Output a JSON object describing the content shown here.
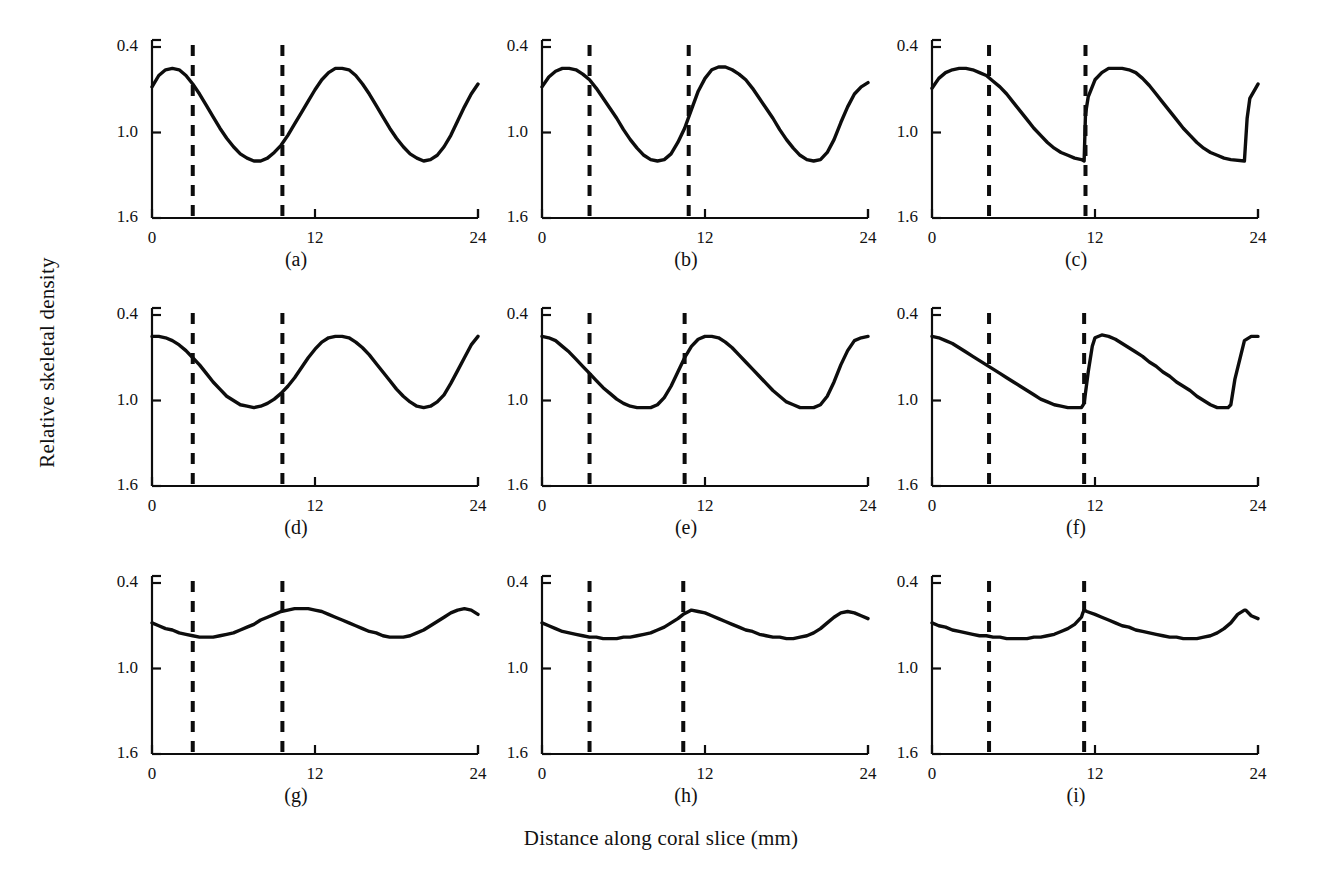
{
  "figure": {
    "ylabel": "Relative skeletal density",
    "xlabel": "Distance along coral slice (mm)",
    "line_color": "#0d0d0d",
    "marker_color": "#0d0d0d"
  },
  "axes": {
    "y_ticks": [
      "1.6",
      "1.0",
      "0.4"
    ],
    "y_tick_values": [
      1.6,
      1.0,
      0.4
    ],
    "x_ticks": [
      "0",
      "12",
      "24"
    ],
    "x_tick_values": [
      0,
      12,
      24
    ],
    "xlim": [
      0,
      24
    ],
    "ylim": [
      0.4,
      1.6
    ]
  },
  "captions": {
    "a": "(a)",
    "b": "(b)",
    "c": "(c)",
    "d": "(d)",
    "e": "(e)",
    "f": "(f)",
    "g": "(g)",
    "h": "(h)",
    "i": "(i)"
  },
  "chart_data": [
    {
      "id": "a",
      "type": "line",
      "title": "(a)",
      "xlabel": "",
      "ylabel": "",
      "xlim": [
        0,
        24
      ],
      "ylim": [
        0.4,
        1.6
      ],
      "xticks": [
        0,
        12,
        24
      ],
      "yticks": [
        0.4,
        1.0,
        1.6
      ],
      "grid": false,
      "legend": "none",
      "annotations": [
        {
          "type": "vertical-dashed-line",
          "x": 3.0
        },
        {
          "type": "vertical-dashed-line",
          "x": 9.6
        }
      ],
      "x": [
        0,
        0.5,
        1,
        1.5,
        2,
        2.5,
        3,
        3.5,
        4,
        4.5,
        5,
        5.5,
        6,
        6.5,
        7,
        7.5,
        8,
        8.5,
        9,
        9.5,
        10,
        10.5,
        11,
        11.5,
        12,
        12.5,
        13,
        13.5,
        14,
        14.5,
        15,
        15.5,
        16,
        16.5,
        17,
        17.5,
        18,
        18.5,
        19,
        19.5,
        20,
        20.5,
        21,
        21.5,
        22,
        22.5,
        23,
        23.5,
        24
      ],
      "values": [
        1.32,
        1.4,
        1.44,
        1.45,
        1.44,
        1.4,
        1.34,
        1.27,
        1.19,
        1.11,
        1.03,
        0.96,
        0.9,
        0.85,
        0.82,
        0.8,
        0.8,
        0.82,
        0.86,
        0.91,
        0.98,
        1.06,
        1.14,
        1.22,
        1.3,
        1.37,
        1.42,
        1.45,
        1.45,
        1.44,
        1.4,
        1.34,
        1.27,
        1.19,
        1.11,
        1.03,
        0.96,
        0.9,
        0.85,
        0.82,
        0.8,
        0.81,
        0.84,
        0.9,
        0.98,
        1.08,
        1.18,
        1.27,
        1.34
      ]
    },
    {
      "id": "b",
      "type": "line",
      "title": "(b)",
      "xlim": [
        0,
        24
      ],
      "ylim": [
        0.4,
        1.6
      ],
      "xticks": [
        0,
        12,
        24
      ],
      "yticks": [
        0.4,
        1.0,
        1.6
      ],
      "grid": false,
      "legend": "none",
      "annotations": [
        {
          "type": "vertical-dashed-line",
          "x": 3.5
        },
        {
          "type": "vertical-dashed-line",
          "x": 10.8
        }
      ],
      "x": [
        0,
        0.5,
        1,
        1.5,
        2,
        2.5,
        3,
        3.5,
        4,
        4.5,
        5,
        5.5,
        6,
        6.5,
        7,
        7.5,
        8,
        8.5,
        9,
        9.5,
        10,
        10.5,
        11,
        11.5,
        12,
        12.5,
        13,
        13.5,
        14,
        14.5,
        15,
        15.5,
        16,
        16.5,
        17,
        17.5,
        18,
        18.5,
        19,
        19.5,
        20,
        20.5,
        21,
        21.5,
        22,
        22.5,
        23,
        23.5,
        24
      ],
      "values": [
        1.32,
        1.39,
        1.43,
        1.45,
        1.45,
        1.44,
        1.41,
        1.37,
        1.31,
        1.24,
        1.17,
        1.1,
        1.02,
        0.95,
        0.89,
        0.84,
        0.81,
        0.8,
        0.81,
        0.85,
        0.93,
        1.03,
        1.16,
        1.29,
        1.38,
        1.44,
        1.46,
        1.46,
        1.44,
        1.41,
        1.37,
        1.31,
        1.24,
        1.17,
        1.1,
        1.02,
        0.95,
        0.89,
        0.84,
        0.81,
        0.8,
        0.81,
        0.86,
        0.95,
        1.07,
        1.18,
        1.27,
        1.32,
        1.35
      ]
    },
    {
      "id": "c",
      "type": "line",
      "title": "(c)",
      "xlim": [
        0,
        24
      ],
      "ylim": [
        0.4,
        1.6
      ],
      "xticks": [
        0,
        12,
        24
      ],
      "yticks": [
        0.4,
        1.0,
        1.6
      ],
      "grid": false,
      "legend": "none",
      "annotations": [
        {
          "type": "vertical-dashed-line",
          "x": 4.2
        },
        {
          "type": "vertical-dashed-line",
          "x": 11.3
        }
      ],
      "x": [
        0,
        0.5,
        1,
        1.5,
        2,
        2.5,
        3,
        3.5,
        4,
        4.5,
        5,
        5.5,
        6,
        6.5,
        7,
        7.5,
        8,
        8.5,
        9,
        9.5,
        10,
        10.5,
        11,
        11.2,
        11.3,
        11.5,
        12,
        12.5,
        13,
        13.5,
        14,
        14.5,
        15,
        15.5,
        16,
        16.5,
        17,
        17.5,
        18,
        18.5,
        19,
        19.5,
        20,
        20.5,
        21,
        21.5,
        22,
        23,
        23.2,
        23.4,
        24
      ],
      "values": [
        1.31,
        1.38,
        1.42,
        1.44,
        1.45,
        1.45,
        1.44,
        1.42,
        1.4,
        1.36,
        1.32,
        1.27,
        1.21,
        1.15,
        1.09,
        1.03,
        0.98,
        0.93,
        0.89,
        0.86,
        0.84,
        0.82,
        0.81,
        0.8,
        1.13,
        1.25,
        1.37,
        1.42,
        1.45,
        1.45,
        1.45,
        1.44,
        1.42,
        1.38,
        1.33,
        1.27,
        1.21,
        1.15,
        1.09,
        1.03,
        0.98,
        0.93,
        0.89,
        0.86,
        0.84,
        0.82,
        0.81,
        0.8,
        1.1,
        1.24,
        1.34
      ]
    },
    {
      "id": "d",
      "type": "line",
      "title": "(d)",
      "xlim": [
        0,
        24
      ],
      "ylim": [
        0.4,
        1.6
      ],
      "xticks": [
        0,
        12,
        24
      ],
      "yticks": [
        0.4,
        1.0,
        1.6
      ],
      "grid": false,
      "legend": "none",
      "annotations": [
        {
          "type": "vertical-dashed-line",
          "x": 3.0
        },
        {
          "type": "vertical-dashed-line",
          "x": 9.6
        }
      ],
      "x": [
        0,
        0.5,
        1,
        1.5,
        2,
        2.5,
        3,
        3.5,
        4,
        4.5,
        5,
        5.5,
        6,
        6.5,
        7,
        7.5,
        8,
        8.5,
        9,
        9.5,
        10,
        10.5,
        11,
        11.5,
        12,
        12.5,
        13,
        13.5,
        14,
        14.5,
        15,
        15.5,
        16,
        16.5,
        17,
        17.5,
        18,
        18.5,
        19,
        19.5,
        20,
        20.5,
        21,
        21.5,
        22,
        22.5,
        23,
        23.5,
        24
      ],
      "values": [
        1.45,
        1.45,
        1.44,
        1.42,
        1.39,
        1.35,
        1.3,
        1.25,
        1.19,
        1.13,
        1.08,
        1.03,
        1.0,
        0.97,
        0.96,
        0.95,
        0.96,
        0.98,
        1.01,
        1.05,
        1.1,
        1.16,
        1.23,
        1.3,
        1.36,
        1.41,
        1.44,
        1.45,
        1.45,
        1.44,
        1.41,
        1.37,
        1.32,
        1.26,
        1.2,
        1.14,
        1.08,
        1.03,
        0.99,
        0.96,
        0.95,
        0.96,
        0.99,
        1.04,
        1.12,
        1.21,
        1.3,
        1.39,
        1.45
      ]
    },
    {
      "id": "e",
      "type": "line",
      "title": "(e)",
      "xlim": [
        0,
        24
      ],
      "ylim": [
        0.4,
        1.6
      ],
      "xticks": [
        0,
        12,
        24
      ],
      "yticks": [
        0.4,
        1.0,
        1.6
      ],
      "grid": false,
      "legend": "none",
      "annotations": [
        {
          "type": "vertical-dashed-line",
          "x": 3.5
        },
        {
          "type": "vertical-dashed-line",
          "x": 10.5
        }
      ],
      "x": [
        0,
        0.5,
        1,
        1.5,
        2,
        2.5,
        3,
        3.5,
        4,
        4.5,
        5,
        5.5,
        6,
        6.5,
        7,
        7.5,
        8,
        8.5,
        9,
        9.5,
        10,
        10.5,
        11,
        11.5,
        12,
        12.5,
        13,
        13.5,
        14,
        14.5,
        15,
        15.5,
        16,
        16.5,
        17,
        17.5,
        18,
        18.5,
        19,
        19.5,
        20,
        20.5,
        21,
        21.5,
        22,
        22.5,
        23,
        23.5,
        24
      ],
      "values": [
        1.45,
        1.44,
        1.42,
        1.38,
        1.34,
        1.29,
        1.24,
        1.19,
        1.14,
        1.09,
        1.05,
        1.01,
        0.98,
        0.96,
        0.95,
        0.95,
        0.95,
        0.97,
        1.02,
        1.1,
        1.2,
        1.3,
        1.38,
        1.43,
        1.45,
        1.45,
        1.44,
        1.41,
        1.37,
        1.32,
        1.27,
        1.22,
        1.17,
        1.12,
        1.07,
        1.03,
        0.99,
        0.97,
        0.95,
        0.95,
        0.95,
        0.97,
        1.03,
        1.13,
        1.25,
        1.35,
        1.42,
        1.44,
        1.45
      ]
    },
    {
      "id": "f",
      "type": "line",
      "title": "(f)",
      "xlim": [
        0,
        24
      ],
      "ylim": [
        0.4,
        1.6
      ],
      "xticks": [
        0,
        12,
        24
      ],
      "yticks": [
        0.4,
        1.0,
        1.6
      ],
      "grid": false,
      "legend": "none",
      "annotations": [
        {
          "type": "vertical-dashed-line",
          "x": 4.2
        },
        {
          "type": "vertical-dashed-line",
          "x": 11.2
        }
      ],
      "x": [
        0,
        0.5,
        1,
        1.5,
        2,
        2.5,
        3,
        3.5,
        4,
        4.5,
        5,
        5.5,
        6,
        6.5,
        7,
        7.5,
        8,
        8.5,
        9,
        9.5,
        10,
        10.2,
        10.5,
        11,
        11.2,
        11.5,
        11.8,
        12,
        12.5,
        13,
        13.5,
        14,
        14.5,
        15,
        15.5,
        16,
        16.5,
        17,
        17.5,
        18,
        18.5,
        19,
        19.5,
        20,
        20.5,
        21,
        21.8,
        22,
        22.3,
        23,
        23.5,
        24
      ],
      "values": [
        1.45,
        1.44,
        1.42,
        1.4,
        1.37,
        1.34,
        1.31,
        1.28,
        1.25,
        1.22,
        1.19,
        1.16,
        1.13,
        1.1,
        1.07,
        1.04,
        1.01,
        0.99,
        0.97,
        0.96,
        0.95,
        0.95,
        0.95,
        0.95,
        0.98,
        1.2,
        1.38,
        1.44,
        1.46,
        1.45,
        1.43,
        1.4,
        1.37,
        1.34,
        1.31,
        1.27,
        1.24,
        1.2,
        1.17,
        1.13,
        1.1,
        1.07,
        1.03,
        1.0,
        0.97,
        0.95,
        0.95,
        0.97,
        1.15,
        1.42,
        1.45,
        1.45
      ]
    },
    {
      "id": "g",
      "type": "line",
      "title": "(g)",
      "xlim": [
        0,
        24
      ],
      "ylim": [
        0.4,
        1.6
      ],
      "xticks": [
        0,
        12,
        24
      ],
      "yticks": [
        0.4,
        1.0,
        1.6
      ],
      "grid": false,
      "legend": "none",
      "annotations": [
        {
          "type": "vertical-dashed-line",
          "x": 3.0
        },
        {
          "type": "vertical-dashed-line",
          "x": 9.6
        }
      ],
      "x": [
        0,
        0.5,
        1,
        1.5,
        2,
        2.5,
        3,
        3.5,
        4,
        4.5,
        5,
        5.5,
        6,
        6.5,
        7,
        7.5,
        8,
        8.5,
        9,
        9.5,
        10,
        10.5,
        11,
        11.5,
        12,
        12.5,
        13,
        13.5,
        14,
        14.5,
        15,
        15.5,
        16,
        16.5,
        17,
        17.5,
        18,
        18.5,
        19,
        19.5,
        20,
        20.5,
        21,
        21.5,
        22,
        22.5,
        23,
        23.5,
        24
      ],
      "values": [
        1.32,
        1.3,
        1.28,
        1.27,
        1.25,
        1.24,
        1.23,
        1.22,
        1.22,
        1.22,
        1.23,
        1.24,
        1.25,
        1.27,
        1.29,
        1.31,
        1.34,
        1.36,
        1.38,
        1.4,
        1.41,
        1.42,
        1.42,
        1.42,
        1.41,
        1.4,
        1.38,
        1.36,
        1.34,
        1.32,
        1.3,
        1.28,
        1.26,
        1.25,
        1.23,
        1.22,
        1.22,
        1.22,
        1.23,
        1.25,
        1.27,
        1.3,
        1.33,
        1.36,
        1.39,
        1.41,
        1.42,
        1.41,
        1.38
      ]
    },
    {
      "id": "h",
      "type": "line",
      "title": "(h)",
      "xlim": [
        0,
        24
      ],
      "ylim": [
        0.4,
        1.6
      ],
      "xticks": [
        0,
        12,
        24
      ],
      "yticks": [
        0.4,
        1.0,
        1.6
      ],
      "grid": false,
      "legend": "none",
      "annotations": [
        {
          "type": "vertical-dashed-line",
          "x": 3.5
        },
        {
          "type": "vertical-dashed-line",
          "x": 10.4
        }
      ],
      "x": [
        0,
        0.5,
        1,
        1.5,
        2,
        2.5,
        3,
        3.5,
        4,
        4.5,
        5,
        5.5,
        6,
        6.5,
        7,
        7.5,
        8,
        8.5,
        9,
        9.5,
        10,
        10.4,
        10.8,
        11,
        11.5,
        12,
        12.5,
        13,
        13.5,
        14,
        14.5,
        15,
        15.5,
        16,
        16.5,
        17,
        17.5,
        18,
        18.5,
        19,
        19.5,
        20,
        20.5,
        21,
        21.5,
        22,
        22.5,
        23,
        23.5,
        24
      ],
      "values": [
        1.32,
        1.3,
        1.28,
        1.26,
        1.25,
        1.24,
        1.23,
        1.22,
        1.22,
        1.21,
        1.21,
        1.21,
        1.22,
        1.22,
        1.23,
        1.24,
        1.25,
        1.27,
        1.29,
        1.32,
        1.35,
        1.38,
        1.4,
        1.41,
        1.4,
        1.39,
        1.37,
        1.35,
        1.33,
        1.31,
        1.29,
        1.27,
        1.26,
        1.24,
        1.23,
        1.22,
        1.22,
        1.21,
        1.21,
        1.22,
        1.23,
        1.25,
        1.28,
        1.32,
        1.36,
        1.39,
        1.4,
        1.39,
        1.37,
        1.35
      ]
    },
    {
      "id": "i",
      "type": "line",
      "title": "(i)",
      "xlim": [
        0,
        24
      ],
      "ylim": [
        0.4,
        1.6
      ],
      "xticks": [
        0,
        12,
        24
      ],
      "yticks": [
        0.4,
        1.0,
        1.6
      ],
      "grid": false,
      "legend": "none",
      "annotations": [
        {
          "type": "vertical-dashed-line",
          "x": 4.2
        },
        {
          "type": "vertical-dashed-line",
          "x": 11.2
        }
      ],
      "x": [
        0,
        0.5,
        1,
        1.5,
        2,
        2.5,
        3,
        3.5,
        4,
        4.5,
        5,
        5.5,
        6,
        6.5,
        7,
        7.5,
        8,
        8.5,
        9,
        9.5,
        10,
        10.5,
        11,
        11.1,
        11.2,
        11.4,
        12,
        12.5,
        13,
        13.5,
        14,
        14.5,
        15,
        15.5,
        16,
        16.5,
        17,
        17.5,
        18,
        18.5,
        19,
        19.5,
        20,
        20.5,
        21,
        21.5,
        22,
        22.5,
        23,
        23.1,
        23.5,
        24
      ],
      "values": [
        1.32,
        1.3,
        1.29,
        1.27,
        1.26,
        1.25,
        1.24,
        1.23,
        1.23,
        1.22,
        1.22,
        1.21,
        1.21,
        1.21,
        1.21,
        1.22,
        1.22,
        1.23,
        1.24,
        1.26,
        1.28,
        1.31,
        1.36,
        1.39,
        1.41,
        1.4,
        1.38,
        1.36,
        1.34,
        1.32,
        1.3,
        1.29,
        1.27,
        1.26,
        1.25,
        1.24,
        1.23,
        1.22,
        1.22,
        1.21,
        1.21,
        1.21,
        1.22,
        1.23,
        1.25,
        1.28,
        1.32,
        1.38,
        1.41,
        1.41,
        1.37,
        1.35
      ]
    }
  ]
}
